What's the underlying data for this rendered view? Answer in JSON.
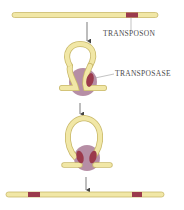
{
  "labels": {
    "transposon": "TRANSPOSON",
    "transposase": "TRANSPOSASE"
  },
  "colors": {
    "dna_fill": "#f1e7a6",
    "dna_stroke": "#c9b96a",
    "transposon": "#9b3a4c",
    "transposase": "#a97a95",
    "arrow": "#444444",
    "text": "#4a4a4a"
  },
  "steps": [
    {
      "name": "linear-dna-with-transposon",
      "transposon_segments": 1
    },
    {
      "name": "loop-with-transposase-bound",
      "transposon_segments": 2
    },
    {
      "name": "loop-excision-complex",
      "transposon_segments": 2
    },
    {
      "name": "linear-dna-after-transposition",
      "transposon_segments": 2
    }
  ]
}
